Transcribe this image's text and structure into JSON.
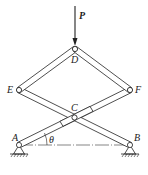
{
  "diagram": {
    "type": "scissor-linkage mechanism",
    "load": {
      "label": "P",
      "direction": "downward",
      "applied_at": "D"
    },
    "joints": [
      {
        "id": "A",
        "label": "A",
        "support": "pin"
      },
      {
        "id": "B",
        "label": "B",
        "support": "pin"
      },
      {
        "id": "C",
        "label": "C",
        "support": "none"
      },
      {
        "id": "D",
        "label": "D",
        "support": "none"
      },
      {
        "id": "E",
        "label": "E",
        "support": "none"
      },
      {
        "id": "F",
        "label": "F",
        "support": "none"
      }
    ],
    "members": [
      {
        "from": "A",
        "to": "F",
        "through": "C"
      },
      {
        "from": "B",
        "to": "E",
        "through": "C"
      },
      {
        "from": "E",
        "to": "D"
      },
      {
        "from": "D",
        "to": "F"
      }
    ],
    "angle": {
      "label": "θ",
      "between": "AC and AB",
      "vertex": "A"
    },
    "centerline": {
      "from": "A",
      "to": "B",
      "style": "dash-dot"
    }
  }
}
